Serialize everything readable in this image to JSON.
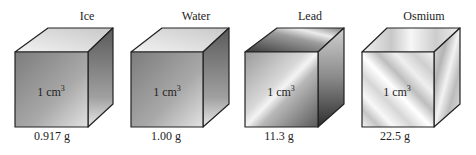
{
  "figure": {
    "cubes": [
      {
        "name": "Ice",
        "volume": "1 cm",
        "volume_exp": "3",
        "mass": "0.917 g"
      },
      {
        "name": "Water",
        "volume": "1 cm",
        "volume_exp": "3",
        "mass": "1.00 g"
      },
      {
        "name": "Lead",
        "volume": "1 cm",
        "volume_exp": "3",
        "mass": "11.3 g"
      },
      {
        "name": "Osmium",
        "volume": "1 cm",
        "volume_exp": "3",
        "mass": "22.5 g"
      }
    ]
  }
}
